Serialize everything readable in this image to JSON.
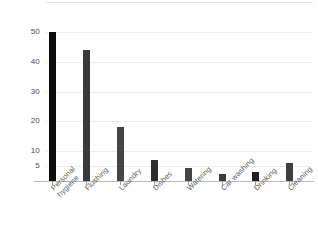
{
  "chart_data": {
    "type": "bar",
    "title": "",
    "subtitle": "",
    "xlabel": "",
    "ylabel": "",
    "categories": [
      "Personal hygiene",
      "Flushing",
      "Laundry",
      "Dishes",
      "Watering",
      "Car washing",
      "Drinking",
      "Cleaning"
    ],
    "category_lines": [
      [
        "Personal",
        "hygiene"
      ],
      [
        "Flushing",
        ""
      ],
      [
        "Laundry",
        ""
      ],
      [
        "Dishes",
        ""
      ],
      [
        "Watering",
        ""
      ],
      [
        "Car washing",
        ""
      ],
      [
        "Drinking",
        ""
      ],
      [
        "Cleaning",
        ""
      ]
    ],
    "values": [
      50,
      44,
      18,
      7,
      4.5,
      2.5,
      3,
      6
    ],
    "ytick_labels": [
      "50",
      "40",
      "30",
      "20",
      "10",
      "5"
    ],
    "ytick_values": [
      50,
      40,
      30,
      20,
      10,
      5
    ],
    "ylim": [
      0,
      60
    ],
    "grid": true,
    "grid_axis": "y",
    "legend": false,
    "bar_colors": [
      "#0d0d0d",
      "#3a3a3a",
      "#454545",
      "#2e2e2e",
      "#454545",
      "#3a3a3a",
      "#1f1f1f",
      "#3f3f3f"
    ]
  },
  "axis": {
    "grid_color": "#ececec",
    "axis_color": "#b9b9b9",
    "tick_color": "#9a9a9a",
    "label_color": "#4a4a4a"
  }
}
